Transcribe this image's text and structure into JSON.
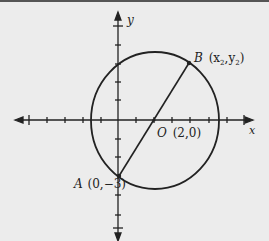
{
  "figure": {
    "type": "coordinate-plane",
    "background": "#ececec",
    "ink_color": "#222222",
    "axes": {
      "x_label": "x",
      "y_label": "y",
      "origin_px": [
        118,
        120
      ],
      "unit_px": 18.3,
      "x_ticks": [
        -5,
        -4,
        -3,
        -2,
        -1,
        1,
        2,
        3,
        4,
        5,
        6,
        7
      ],
      "y_ticks": [
        -5,
        -4,
        -3,
        -2,
        -1,
        1,
        2,
        3,
        4,
        5
      ]
    },
    "circle": {
      "center_label": "O",
      "center_coords": "(2,0)",
      "center": [
        2,
        0
      ]
    },
    "points": {
      "A": {
        "name": "A",
        "coords": "(0,−3)",
        "value": [
          0,
          -3
        ]
      },
      "B": {
        "name": "B",
        "coords_prefix": "(x",
        "sub1": "2",
        "sep": ",y",
        "sub2": "2",
        "coords_suffix": ")"
      }
    },
    "segment": "AB (diameter through O)"
  }
}
